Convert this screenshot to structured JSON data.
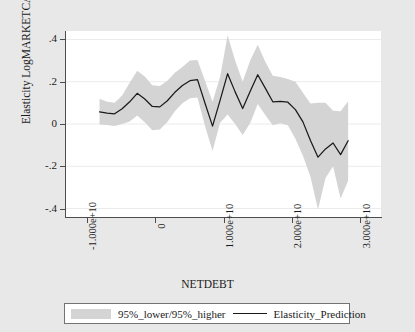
{
  "chart_data": {
    "type": "line",
    "title": "",
    "xlabel": "NETDEBT",
    "ylabel": "Elasticity LogMARKETCAP",
    "xlim": [
      -13000000000,
      33000000000
    ],
    "ylim": [
      -0.44,
      0.44
    ],
    "xticks": [
      -10000000000,
      0,
      10000000000,
      20000000000,
      30000000000
    ],
    "xtick_labels": [
      "-1.000e+10",
      "0",
      "1.000e+10",
      "2.000e+10",
      "3.000e+10"
    ],
    "yticks": [
      0.4,
      0.2,
      0,
      -0.2,
      -0.4
    ],
    "ytick_labels": [
      ".4",
      ".2",
      "0",
      "-.2",
      "-.4"
    ],
    "grid": "horizontal",
    "legend_position": "below-axis",
    "band_color": "#d4d4d4",
    "line_color": "#1a1a1a",
    "plot_background": "#ffffff",
    "figure_background": "#e8e8e8",
    "x": [
      -8100000000,
      -7000000000,
      -5900000000,
      -4800000000,
      -3700000000,
      -2600000000,
      -1500000000,
      -400000000,
      700000000,
      1800000000,
      2900000000,
      4000000000,
      5100000000,
      6200000000,
      7300000000,
      8400000000,
      9500000000,
      10600000000,
      11700000000,
      12800000000,
      13900000000,
      15000000000,
      16100000000,
      17200000000,
      18300000000,
      19400000000,
      20500000000,
      21600000000,
      22700000000,
      23800000000,
      24900000000,
      26000000000,
      27100000000,
      28200000000
    ],
    "series": [
      {
        "name": "Elasticity_Prediction",
        "type": "line",
        "values": [
          0.057,
          0.052,
          0.048,
          0.072,
          0.105,
          0.145,
          0.118,
          0.083,
          0.081,
          0.11,
          0.15,
          0.182,
          0.205,
          0.21,
          0.098,
          -0.01,
          0.112,
          0.238,
          0.152,
          0.073,
          0.155,
          0.233,
          0.17,
          0.105,
          0.107,
          0.103,
          0.068,
          0.01,
          -0.078,
          -0.157,
          -0.118,
          -0.09,
          -0.145,
          -0.079
        ]
      },
      {
        "name": "95%_lower",
        "type": "band_lower",
        "values": [
          -0.002,
          -0.005,
          -0.01,
          0.0,
          0.012,
          0.04,
          0.008,
          -0.03,
          -0.026,
          0.01,
          0.06,
          0.098,
          0.122,
          0.125,
          -0.01,
          -0.128,
          0.006,
          0.045,
          0.0,
          -0.052,
          0.005,
          0.095,
          0.042,
          -0.006,
          0.004,
          -0.006,
          -0.07,
          -0.15,
          -0.25,
          -0.405,
          -0.255,
          -0.2,
          -0.352,
          -0.268
        ]
      },
      {
        "name": "95%_higher",
        "type": "band_upper",
        "values": [
          0.12,
          0.105,
          0.1,
          0.135,
          0.195,
          0.252,
          0.225,
          0.183,
          0.18,
          0.205,
          0.242,
          0.27,
          0.3,
          0.303,
          0.205,
          0.105,
          0.222,
          0.42,
          0.3,
          0.2,
          0.3,
          0.375,
          0.295,
          0.228,
          0.222,
          0.213,
          0.2,
          0.148,
          0.097,
          0.1,
          0.1,
          0.063,
          0.06,
          0.108
        ]
      }
    ],
    "legend_entries": [
      {
        "label": "95%_lower/95%_higher",
        "marker": "band",
        "color": "#d4d4d4"
      },
      {
        "label": "Elasticity_Prediction",
        "marker": "line",
        "color": "#1a1a1a"
      }
    ]
  }
}
